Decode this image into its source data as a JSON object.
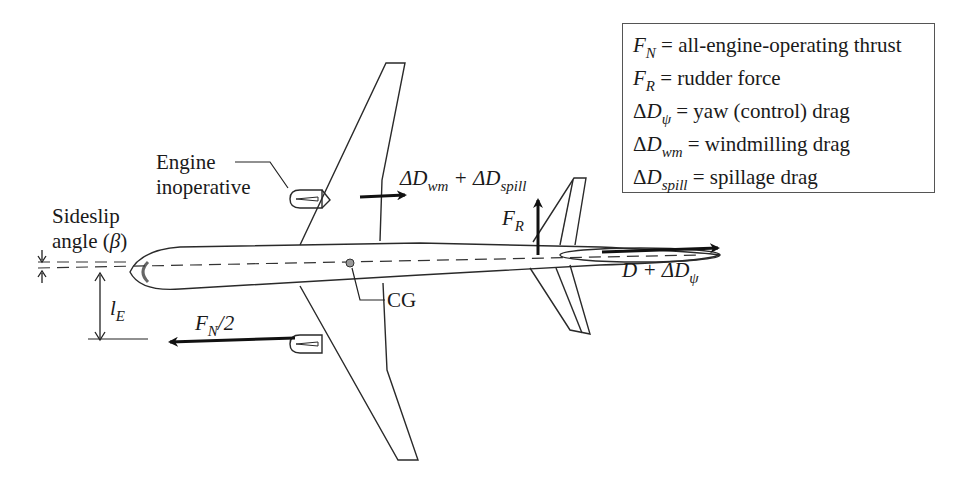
{
  "legend": {
    "items": [
      {
        "symbol": "F",
        "symbol_sub": "N",
        "delta": "",
        "desc": "= all-engine-operating thrust"
      },
      {
        "symbol": "F",
        "symbol_sub": "R",
        "delta": "",
        "desc": "= rudder force"
      },
      {
        "symbol": "D",
        "symbol_sub": "ψ",
        "delta": "Δ",
        "desc": "= yaw (control) drag"
      },
      {
        "symbol": "D",
        "symbol_sub": "wm",
        "delta": "Δ",
        "desc": "= windmilling drag"
      },
      {
        "symbol": "D",
        "symbol_sub": "spill",
        "delta": "Δ",
        "desc": "= spillage drag"
      }
    ]
  },
  "labels": {
    "engine_inoperative_line1": "Engine",
    "engine_inoperative_line2": "inoperative",
    "sideslip_line1": "Sideslip",
    "sideslip_line2_text": "angle (",
    "sideslip_symbol": "β",
    "sideslip_close": ")",
    "le_main": "l",
    "le_sub": "E",
    "fn2_main": "F",
    "fn2_sub": "N",
    "fn2_rest": "/2",
    "cg": "CG",
    "fr_main": "F",
    "fr_sub": "R",
    "drag_main": "D + ΔD",
    "drag_sub": "ψ",
    "wm_delta1": "ΔD",
    "wm_sub1": "wm",
    "wm_plus": " + ΔD",
    "wm_sub2": "spill"
  },
  "colors": {
    "line": "#2a2a2a",
    "arrow": "#111111",
    "background": "#ffffff"
  }
}
